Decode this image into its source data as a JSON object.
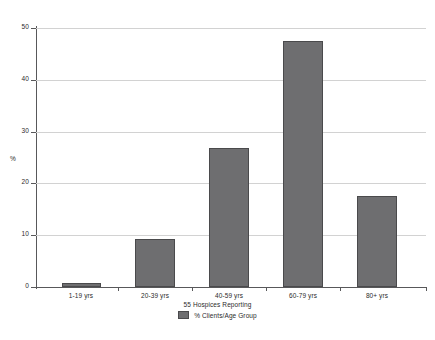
{
  "chart_data": {
    "type": "bar",
    "title": "",
    "subtitle": "55 Hospices Reporting",
    "xlabel": "",
    "ylabel": "%",
    "categories": [
      "1-19 yrs",
      "20-39 yrs",
      "40-59 yrs",
      "60-79 yrs",
      "80+ yrs"
    ],
    "values": [
      0.8,
      9.3,
      26.8,
      47.5,
      17.5
    ],
    "series": [
      {
        "name": "% Clients/Age Group",
        "values": [
          0.8,
          9.3,
          26.8,
          47.5,
          17.5
        ]
      }
    ],
    "ylim": [
      0,
      50
    ],
    "yticks": [
      0,
      10,
      20,
      30,
      40,
      50
    ],
    "ytick_labels": [
      "0",
      "10",
      "20",
      "30",
      "40",
      "50"
    ],
    "grid": true,
    "legend": {
      "position": "bottom",
      "entries": [
        {
          "label": "% Clients/Age Group",
          "color": "#6e6e70"
        }
      ]
    },
    "colors": {
      "bar_fill": "#6e6e70",
      "bar_border": "#4a4a4c",
      "gridline": "#d2d2d2",
      "axis": "#58585a",
      "text": "#2b2b2b",
      "background": "#ffffff"
    }
  }
}
